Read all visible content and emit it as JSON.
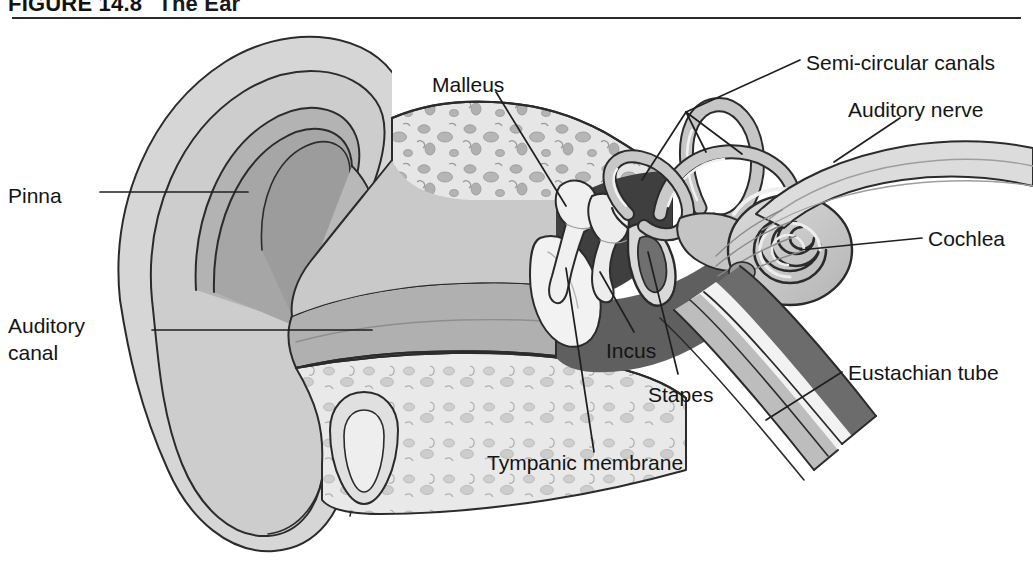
{
  "figure": {
    "number": "FIGURE 14.8",
    "caption": "The Ear",
    "title_full": "FIGURE 14.8  The Ear"
  },
  "labels": [
    {
      "id": "pinna",
      "text": "Pinna",
      "x": 8,
      "y": 183
    },
    {
      "id": "auditory-canal",
      "text": "Auditory\ncanal",
      "line1": "Auditory",
      "line2": "canal",
      "x": 8,
      "y": 312
    },
    {
      "id": "malleus",
      "text": "Malleus",
      "x": 432,
      "y": 72
    },
    {
      "id": "semi-circular-canals",
      "text": "Semi-circular canals",
      "x": 806,
      "y": 50
    },
    {
      "id": "auditory-nerve",
      "text": "Auditory nerve",
      "x": 848,
      "y": 97
    },
    {
      "id": "cochlea",
      "text": "Cochlea",
      "x": 928,
      "y": 226
    },
    {
      "id": "eustachian-tube",
      "text": "Eustachian tube",
      "x": 848,
      "y": 360
    },
    {
      "id": "incus",
      "text": "Incus",
      "x": 606,
      "y": 338
    },
    {
      "id": "stapes",
      "text": "Stapes",
      "x": 648,
      "y": 382
    },
    {
      "id": "tympanic-membrane",
      "text": "Tympanic membrane",
      "x": 487,
      "y": 450
    }
  ],
  "structures": [
    {
      "id": "pinna",
      "name": "Pinna (auricle)"
    },
    {
      "id": "helix",
      "name": "Helix"
    },
    {
      "id": "antihelix",
      "name": "Antihelix"
    },
    {
      "id": "concha",
      "name": "Concha"
    },
    {
      "id": "earlobe",
      "name": "Earlobe"
    },
    {
      "id": "auditory-canal",
      "name": "Auditory canal"
    },
    {
      "id": "tympanic-membrane",
      "name": "Tympanic membrane"
    },
    {
      "id": "malleus",
      "name": "Malleus"
    },
    {
      "id": "incus",
      "name": "Incus"
    },
    {
      "id": "stapes",
      "name": "Stapes"
    },
    {
      "id": "semi-circular-canals",
      "name": "Semi-circular canals"
    },
    {
      "id": "cochlea",
      "name": "Cochlea"
    },
    {
      "id": "auditory-nerve",
      "name": "Auditory nerve"
    },
    {
      "id": "eustachian-tube",
      "name": "Eustachian tube"
    },
    {
      "id": "temporal-bone",
      "name": "Temporal bone"
    },
    {
      "id": "middle-ear-cavity",
      "name": "Middle ear cavity"
    }
  ],
  "colors": {
    "ink": "#1a1a1a",
    "outline": "#2b2b2b",
    "skin_light": "#d9d9d9",
    "skin_mid": "#c2c2c2",
    "skin_dark": "#a8a8a8",
    "canal_dark": "#9b9b9b",
    "bone_light": "#e4e4e4",
    "bone_fleck": "#b0b0b0",
    "cavity_dark": "#6e6e6e",
    "cavity_darkest": "#3c3c3c",
    "ossicle": "#efefef",
    "tube_light": "#dedede",
    "white": "#ffffff"
  }
}
